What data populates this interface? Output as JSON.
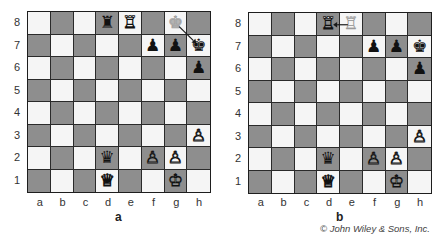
{
  "colors": {
    "light_square": "#f5f5f5",
    "dark_square": "#8e8e8e",
    "grid": "#2a2a2a",
    "ghost_piece": "#b4b4b4"
  },
  "files": [
    "a",
    "b",
    "c",
    "d",
    "e",
    "f",
    "g",
    "h"
  ],
  "ranks": [
    "8",
    "7",
    "6",
    "5",
    "4",
    "3",
    "2",
    "1"
  ],
  "icons": {
    "white-king": "♔",
    "white-queen": "♕",
    "white-rook": "♖",
    "white-pawn": "♙",
    "black-king": "♚",
    "black-queen": "♛",
    "black-rook": "♜",
    "black-pawn": "♟"
  },
  "boards": [
    {
      "caption": "a",
      "pieces": [
        {
          "square": "d8",
          "piece": "black-rook",
          "glyph": "♜",
          "color": "black"
        },
        {
          "square": "e8",
          "piece": "white-rook",
          "glyph": "♖",
          "color": "white"
        },
        {
          "square": "g8",
          "piece": "black-king",
          "glyph": "♚",
          "color": "ghost"
        },
        {
          "square": "f7",
          "piece": "black-pawn",
          "glyph": "♟",
          "color": "black"
        },
        {
          "square": "g7",
          "piece": "black-pawn",
          "glyph": "♟",
          "color": "black"
        },
        {
          "square": "h7",
          "piece": "black-king",
          "glyph": "♚",
          "color": "black"
        },
        {
          "square": "h6",
          "piece": "black-pawn",
          "glyph": "♟",
          "color": "black"
        },
        {
          "square": "h3",
          "piece": "white-pawn",
          "glyph": "♙",
          "color": "white"
        },
        {
          "square": "d2",
          "piece": "black-queen",
          "glyph": "♛",
          "color": "black"
        },
        {
          "square": "f2",
          "piece": "white-pawn",
          "glyph": "♙",
          "color": "white"
        },
        {
          "square": "g2",
          "piece": "white-pawn",
          "glyph": "♙",
          "color": "white"
        },
        {
          "square": "d1",
          "piece": "white-queen",
          "glyph": "♕",
          "color": "white"
        },
        {
          "square": "g1",
          "piece": "white-king",
          "glyph": "♔",
          "color": "white"
        }
      ],
      "arrow": {
        "from": "g8",
        "to": "h7"
      }
    },
    {
      "caption": "b",
      "pieces": [
        {
          "square": "d8",
          "piece": "white-rook",
          "glyph": "♖",
          "color": "white"
        },
        {
          "square": "e8",
          "piece": "white-rook",
          "glyph": "♖",
          "color": "ghost"
        },
        {
          "square": "f7",
          "piece": "black-pawn",
          "glyph": "♟",
          "color": "black"
        },
        {
          "square": "g7",
          "piece": "black-pawn",
          "glyph": "♟",
          "color": "black"
        },
        {
          "square": "h7",
          "piece": "black-king",
          "glyph": "♚",
          "color": "black"
        },
        {
          "square": "h6",
          "piece": "black-pawn",
          "glyph": "♟",
          "color": "black"
        },
        {
          "square": "h3",
          "piece": "white-pawn",
          "glyph": "♙",
          "color": "white"
        },
        {
          "square": "d2",
          "piece": "black-queen",
          "glyph": "♛",
          "color": "black"
        },
        {
          "square": "f2",
          "piece": "white-pawn",
          "glyph": "♙",
          "color": "white"
        },
        {
          "square": "g2",
          "piece": "white-pawn",
          "glyph": "♙",
          "color": "white"
        },
        {
          "square": "d1",
          "piece": "white-queen",
          "glyph": "♕",
          "color": "white"
        },
        {
          "square": "g1",
          "piece": "white-king",
          "glyph": "♔",
          "color": "white"
        }
      ],
      "arrow": {
        "from": "e8",
        "to": "d8"
      }
    }
  ],
  "copyright": "© John Wiley & Sons, Inc."
}
